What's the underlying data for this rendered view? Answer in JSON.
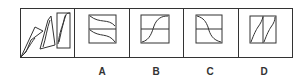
{
  "question": {
    "stem_label": "sequence",
    "options": [
      {
        "id": "A",
        "label": "A"
      },
      {
        "id": "B",
        "label": "B"
      },
      {
        "id": "C",
        "label": "C"
      },
      {
        "id": "D",
        "label": "D"
      }
    ],
    "colors": {
      "stroke": "#333333",
      "background": "#ffffff"
    }
  }
}
